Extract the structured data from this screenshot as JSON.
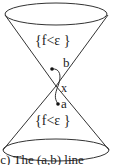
{
  "diagram": {
    "upper_region_label": "{f<ε }",
    "lower_region_label": "{f<ε }",
    "point_b_label": "b",
    "point_a_label": "a",
    "vertex_label": "x",
    "caption": "(c) The (a,b) line"
  },
  "colors": {
    "stroke": "#333333",
    "text": "#222222",
    "background": "#ffffff"
  }
}
